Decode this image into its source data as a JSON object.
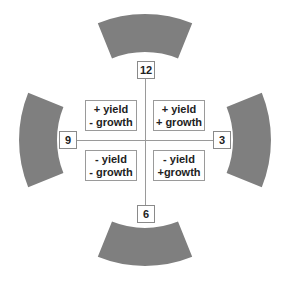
{
  "clock_labels": {
    "top": "12",
    "right": "3",
    "bottom": "6",
    "left": "9"
  },
  "quadrants": {
    "top_left": {
      "line1": "+ yield",
      "line2": "- growth"
    },
    "top_right": {
      "line1": "+ yield",
      "line2": "+ growth"
    },
    "bottom_left": {
      "line1": "- yield",
      "line2": "- growth"
    },
    "bottom_right": {
      "line1": "- yield",
      "line2": "+growth"
    }
  },
  "colors": {
    "arc_fill": "#7f7f7f",
    "axis_line": "#9a9a9a",
    "box_border": "#8a8a8a"
  }
}
